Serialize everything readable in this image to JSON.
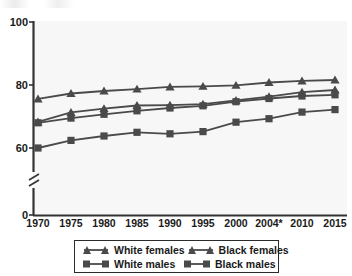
{
  "chart_data": {
    "type": "line",
    "title": "",
    "subtitle": "",
    "xlabel": "",
    "ylabel": "",
    "x": [
      1970,
      1975,
      1980,
      1985,
      1990,
      1995,
      2000,
      2004,
      2010,
      2015
    ],
    "xtick_labels": [
      "1970",
      "1975",
      "1980",
      "1985",
      "1990",
      "1995",
      "2000",
      "2004*",
      "2010",
      "2015"
    ],
    "ytick_labels": [
      "0",
      "60",
      "80",
      "100"
    ],
    "ytick_values": [
      0,
      60,
      80,
      100
    ],
    "ylim": [
      56,
      100
    ],
    "axis_break": true,
    "axis_break_note": "y-axis broken between 0 and 60",
    "grid": false,
    "legend_position": "bottom",
    "series": [
      {
        "name": "White females",
        "marker": "triangle",
        "color": "#4a4a4a",
        "values": [
          75.6,
          77.3,
          78.1,
          78.7,
          79.4,
          79.6,
          79.9,
          80.8,
          81.3,
          81.6
        ]
      },
      {
        "name": "Black females",
        "marker": "triangle",
        "color": "#4a4a4a",
        "values": [
          68.3,
          71.3,
          72.5,
          73.5,
          73.6,
          73.9,
          75.1,
          76.3,
          77.7,
          78.4
        ]
      },
      {
        "name": "White males",
        "marker": "square",
        "color": "#4a4a4a",
        "values": [
          68.0,
          69.5,
          70.7,
          71.8,
          72.7,
          73.4,
          74.7,
          75.7,
          76.5,
          76.9
        ]
      },
      {
        "name": "Black males",
        "marker": "square",
        "color": "#4a4a4a",
        "values": [
          60.0,
          62.4,
          63.8,
          65.0,
          64.5,
          65.2,
          68.2,
          69.3,
          71.4,
          72.2
        ]
      }
    ]
  },
  "legend": {
    "entries": [
      {
        "label": "White females",
        "marker": "triangle"
      },
      {
        "label": "Black females",
        "marker": "triangle"
      },
      {
        "label": "White males",
        "marker": "square"
      },
      {
        "label": "Black males",
        "marker": "square"
      }
    ]
  },
  "colors": {
    "line": "#4a4a4a",
    "axis": "#333333",
    "text": "#1a1a1a",
    "plot_background": "#f7f7f7",
    "page_background": "#ffffff"
  }
}
